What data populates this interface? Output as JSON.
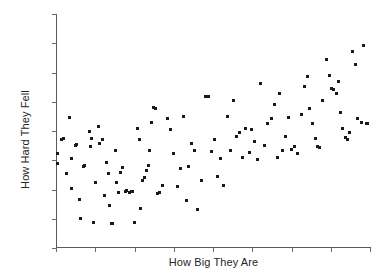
{
  "chart_data": {
    "type": "scatter",
    "title": "",
    "subtitle": "",
    "xlabel": "How Big They Are",
    "ylabel": "How Hard They Fell",
    "xlim": [
      0,
      100
    ],
    "ylim": [
      0,
      100
    ],
    "grid": false,
    "legend": null,
    "legend_position": "none",
    "x_tick_labels": [],
    "y_tick_labels": [],
    "x_tick_count": 9,
    "y_tick_count": 9,
    "marker": {
      "shape": "square",
      "color": "#1a1a1a",
      "size_px": 3
    },
    "annotations": [],
    "n_points": 120,
    "series": [
      {
        "name": "observations",
        "color": "#1a1a1a",
        "points": [
          [
            0.6,
            40.3
          ],
          [
            0.6,
            35.8
          ],
          [
            1.9,
            46.0
          ],
          [
            2.3,
            46.4
          ],
          [
            3.2,
            31.6
          ],
          [
            4.2,
            55.5
          ],
          [
            4.9,
            37.9
          ],
          [
            5.0,
            25.1
          ],
          [
            6.1,
            43.5
          ],
          [
            6.5,
            43.9
          ],
          [
            7.4,
            20.4
          ],
          [
            7.8,
            12.2
          ],
          [
            8.9,
            34.4
          ],
          [
            9.1,
            34.8
          ],
          [
            10.6,
            49.6
          ],
          [
            11.0,
            43.2
          ],
          [
            11.4,
            46.6
          ],
          [
            11.8,
            10.6
          ],
          [
            12.5,
            27.5
          ],
          [
            13.4,
            51.6
          ],
          [
            13.8,
            44.4
          ],
          [
            14.8,
            46.2
          ],
          [
            15.5,
            22.0
          ],
          [
            16.0,
            36.3
          ],
          [
            16.6,
            31.4
          ],
          [
            17.0,
            18.0
          ],
          [
            17.6,
            10.3
          ],
          [
            18.0,
            10.2
          ],
          [
            18.8,
            41.5
          ],
          [
            19.4,
            27.6
          ],
          [
            20.0,
            23.2
          ],
          [
            20.7,
            32.1
          ],
          [
            21.3,
            34.0
          ],
          [
            22.0,
            23.8
          ],
          [
            22.6,
            24.1
          ],
          [
            23.3,
            23.6
          ],
          [
            24.0,
            23.9
          ],
          [
            24.3,
            24.0
          ],
          [
            25.1,
            10.5
          ],
          [
            25.8,
            51.0
          ],
          [
            26.5,
            46.0
          ],
          [
            27.0,
            16.5
          ],
          [
            27.7,
            28.5
          ],
          [
            28.2,
            30.0
          ],
          [
            28.7,
            32.7
          ],
          [
            29.3,
            34.9
          ],
          [
            29.9,
            41.3
          ],
          [
            30.5,
            53.6
          ],
          [
            31.2,
            60.0
          ],
          [
            31.8,
            59.6
          ],
          [
            32.4,
            23.0
          ],
          [
            33.1,
            23.4
          ],
          [
            34.0,
            26.5
          ],
          [
            35.5,
            55.2
          ],
          [
            36.4,
            50.3
          ],
          [
            37.5,
            40.0
          ],
          [
            38.7,
            25.8
          ],
          [
            39.6,
            33.9
          ],
          [
            40.5,
            55.8
          ],
          [
            41.6,
            20.0
          ],
          [
            42.3,
            34.6
          ],
          [
            43.0,
            44.5
          ],
          [
            44.0,
            41.4
          ],
          [
            45.0,
            16.2
          ],
          [
            46.2,
            28.4
          ],
          [
            47.5,
            64.4
          ],
          [
            48.5,
            64.6
          ],
          [
            49.5,
            41.2
          ],
          [
            50.4,
            46.0
          ],
          [
            51.5,
            30.3
          ],
          [
            52.4,
            37.8
          ],
          [
            53.5,
            26.5
          ],
          [
            54.5,
            56.0
          ],
          [
            55.6,
            41.3
          ],
          [
            56.6,
            62.8
          ],
          [
            57.5,
            47.6
          ],
          [
            58.5,
            49.0
          ],
          [
            59.3,
            38.5
          ],
          [
            60.4,
            51.0
          ],
          [
            61.5,
            40.4
          ],
          [
            62.3,
            50.4
          ],
          [
            63.3,
            45.3
          ],
          [
            64.3,
            37.4
          ],
          [
            65.2,
            70.2
          ],
          [
            66.4,
            43.7
          ],
          [
            67.5,
            52.8
          ],
          [
            68.5,
            55.0
          ],
          [
            69.6,
            61.2
          ],
          [
            70.5,
            38.4
          ],
          [
            71.3,
            66.0
          ],
          [
            72.2,
            41.6
          ],
          [
            73.0,
            47.5
          ],
          [
            74.0,
            55.6
          ],
          [
            75.0,
            42.0
          ],
          [
            76.0,
            43.0
          ],
          [
            77.0,
            40.3
          ],
          [
            78.2,
            56.8
          ],
          [
            79.0,
            68.7
          ],
          [
            80.0,
            73.0
          ],
          [
            80.8,
            59.5
          ],
          [
            81.8,
            52.9
          ],
          [
            82.5,
            46.5
          ],
          [
            83.3,
            43.0
          ],
          [
            84.0,
            42.7
          ],
          [
            85.0,
            63.0
          ],
          [
            86.0,
            80.4
          ],
          [
            87.0,
            73.6
          ],
          [
            87.8,
            68.0
          ],
          [
            88.5,
            67.5
          ],
          [
            89.4,
            66.0
          ],
          [
            90.0,
            71.2
          ],
          [
            90.7,
            57.6
          ],
          [
            91.4,
            50.8
          ],
          [
            92.2,
            47.0
          ],
          [
            92.9,
            46.2
          ],
          [
            93.6,
            49.2
          ],
          [
            94.5,
            84.0
          ],
          [
            95.3,
            78.5
          ],
          [
            96.0,
            55.0
          ],
          [
            97.2,
            53.5
          ],
          [
            98.0,
            86.5
          ],
          [
            98.8,
            53.2
          ],
          [
            99.3,
            52.8
          ]
        ]
      }
    ]
  }
}
